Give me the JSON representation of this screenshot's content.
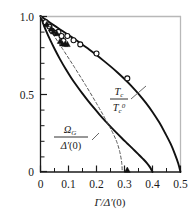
{
  "chart_data": {
    "type": "line",
    "title": "",
    "xlabel": "Γ/Δ′(0)",
    "ylabel": "",
    "xlim": [
      0,
      0.5
    ],
    "ylim": [
      0,
      1.0
    ],
    "grid": false,
    "legend_position": "inside-annotations",
    "x_ticks": [
      0,
      0.1,
      0.2,
      0.3,
      0.4,
      0.5
    ],
    "x_tick_labels": [
      "0",
      "0.1",
      "0.2",
      "0.3",
      "0.4",
      "0.5"
    ],
    "x_minor_ticks": [
      0.05,
      0.15,
      0.25,
      0.35,
      0.45
    ],
    "y_ticks": [
      0,
      0.5,
      1.0
    ],
    "y_tick_labels": [
      "0",
      "0.5",
      "1.0"
    ],
    "y_minor_ticks": [
      0.1,
      0.2,
      0.3,
      0.4,
      0.6,
      0.7,
      0.8,
      0.9
    ],
    "series": [
      {
        "name": "Tc/Tc0",
        "label": "T_c / T_c^0",
        "style": "solid",
        "color": "#111111",
        "points": [
          [
            0.0,
            1.0
          ],
          [
            0.02,
            0.975
          ],
          [
            0.04,
            0.95
          ],
          [
            0.06,
            0.926
          ],
          [
            0.08,
            0.902
          ],
          [
            0.1,
            0.878
          ],
          [
            0.125,
            0.848
          ],
          [
            0.15,
            0.816
          ],
          [
            0.175,
            0.784
          ],
          [
            0.2,
            0.75
          ],
          [
            0.225,
            0.714
          ],
          [
            0.25,
            0.677
          ],
          [
            0.275,
            0.638
          ],
          [
            0.3,
            0.596
          ],
          [
            0.325,
            0.551
          ],
          [
            0.35,
            0.501
          ],
          [
            0.375,
            0.446
          ],
          [
            0.4,
            0.385
          ],
          [
            0.425,
            0.315
          ],
          [
            0.445,
            0.25
          ],
          [
            0.465,
            0.18
          ],
          [
            0.48,
            0.115
          ],
          [
            0.492,
            0.055
          ],
          [
            0.5,
            0.0
          ]
        ]
      },
      {
        "name": "OmegaG/Delta0-solid",
        "label": "Ω_G / Δ′(0)",
        "style": "solid",
        "color": "#111111",
        "points": [
          [
            0.0,
            1.0
          ],
          [
            0.01,
            0.95
          ],
          [
            0.02,
            0.905
          ],
          [
            0.035,
            0.845
          ],
          [
            0.05,
            0.79
          ],
          [
            0.07,
            0.722
          ],
          [
            0.09,
            0.66
          ],
          [
            0.11,
            0.603
          ],
          [
            0.13,
            0.551
          ],
          [
            0.15,
            0.502
          ],
          [
            0.17,
            0.456
          ],
          [
            0.19,
            0.412
          ],
          [
            0.21,
            0.37
          ],
          [
            0.23,
            0.33
          ],
          [
            0.25,
            0.291
          ],
          [
            0.27,
            0.254
          ],
          [
            0.29,
            0.218
          ],
          [
            0.31,
            0.183
          ],
          [
            0.33,
            0.148
          ],
          [
            0.35,
            0.113
          ],
          [
            0.365,
            0.086
          ],
          [
            0.38,
            0.057
          ],
          [
            0.392,
            0.028
          ],
          [
            0.4,
            0.0
          ]
        ]
      },
      {
        "name": "OmegaG-asymptote-dashed",
        "label": "Ω_G / Δ′(0)",
        "style": "dashed",
        "color": "#555555",
        "points": [
          [
            0.0,
            1.0
          ],
          [
            0.04,
            0.895
          ],
          [
            0.08,
            0.786
          ],
          [
            0.12,
            0.675
          ],
          [
            0.16,
            0.56
          ],
          [
            0.2,
            0.44
          ],
          [
            0.23,
            0.345
          ],
          [
            0.255,
            0.262
          ],
          [
            0.272,
            0.195
          ],
          [
            0.283,
            0.13
          ],
          [
            0.29,
            0.06
          ],
          [
            0.292,
            0.0
          ]
        ]
      }
    ],
    "scatter": [
      {
        "name": "open-circles",
        "marker": "circle-open",
        "color": "#111111",
        "points": [
          [
            0.018,
            0.96
          ],
          [
            0.032,
            0.932
          ],
          [
            0.041,
            0.905
          ],
          [
            0.053,
            0.892
          ],
          [
            0.064,
            0.898
          ],
          [
            0.075,
            0.872
          ],
          [
            0.082,
            0.84
          ],
          [
            0.096,
            0.872
          ],
          [
            0.118,
            0.845
          ],
          [
            0.142,
            0.818
          ],
          [
            0.2,
            0.76
          ],
          [
            0.31,
            0.6
          ]
        ]
      },
      {
        "name": "filled-triangles",
        "marker": "triangle-filled",
        "color": "#111111",
        "points": [
          [
            0.022,
            0.945
          ],
          [
            0.038,
            0.918
          ],
          [
            0.046,
            0.9
          ],
          [
            0.058,
            0.888
          ],
          [
            0.07,
            0.838
          ],
          [
            0.078,
            0.822
          ],
          [
            0.088,
            0.82
          ],
          [
            0.096,
            0.818
          ],
          [
            0.31,
            0.012
          ]
        ]
      }
    ],
    "annotations": [
      {
        "name": "tc-ratio-label",
        "numerator": "T",
        "numerator_sub": "c",
        "denominator": "T",
        "denominator_sub": "c",
        "denominator_sup": "0",
        "leader_line": true
      },
      {
        "name": "omega-ratio-label",
        "numerator": "Ω",
        "numerator_sub": "G",
        "denominator": "Δ′(0)",
        "leader_line": true
      }
    ]
  },
  "axes": {
    "x_label": "Γ/Δ′(0)",
    "x_label_parts": {
      "gamma": "Γ",
      "slash": "/",
      "delta": "Δ",
      "prime": "′",
      "paren": "(0)"
    },
    "x_tick_labels": [
      "0",
      "0.1",
      "0.2",
      "0.3",
      "0.4",
      "0.5"
    ],
    "y_tick_labels": [
      "1.0",
      "0.5",
      "0"
    ]
  },
  "labels": {
    "tc_numerator": "T",
    "tc_numerator_sub": "c",
    "tc_denominator": "T",
    "tc_denominator_sub": "c",
    "tc_denominator_sup": "0",
    "omega_numerator": "Ω",
    "omega_numerator_sub": "G",
    "omega_denominator_delta": "Δ",
    "omega_denominator_prime": "′",
    "omega_denominator_paren": "(0)"
  },
  "colors": {
    "curve": "#111111",
    "dashed": "#555555",
    "frame_top_right": "#b8b8b8",
    "axis": "#1a1a1a",
    "background": "#ffffff"
  }
}
